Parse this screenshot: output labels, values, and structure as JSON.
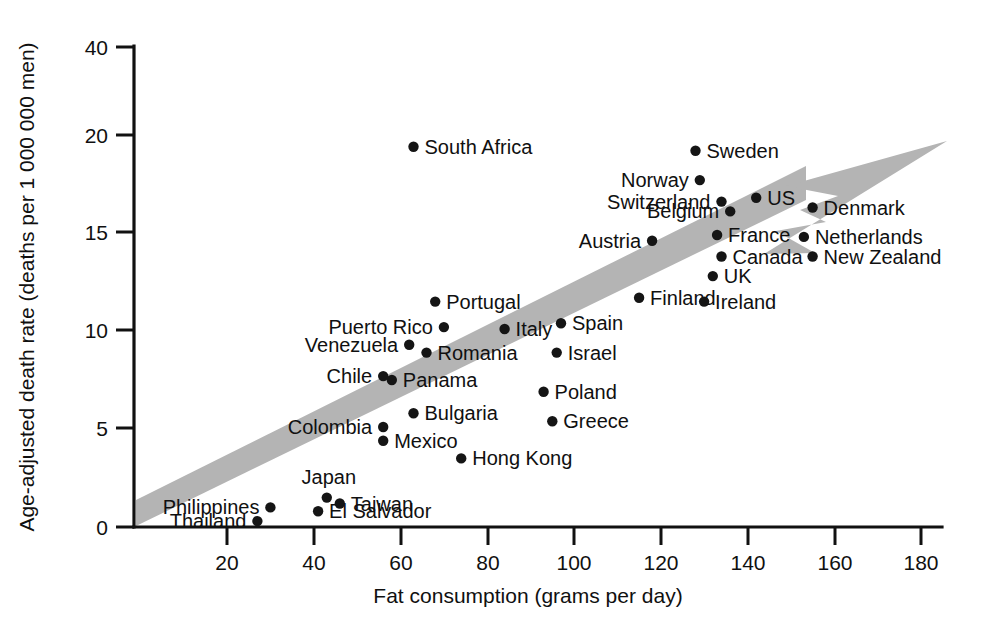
{
  "chart_data": {
    "type": "scatter",
    "title": "",
    "xlabel": "Fat consumption (grams per day)",
    "ylabel": "Age-adjusted death rate (deaths per 1 000 000 men)",
    "xlim": [
      0,
      183
    ],
    "ylim": [
      0,
      40
    ],
    "grid": false,
    "legend": null,
    "xticks": [
      20,
      40,
      60,
      80,
      100,
      120,
      140,
      160,
      180
    ],
    "yticks": [
      0,
      5,
      10,
      15,
      20,
      40
    ],
    "y_axis_note": "Axis is broken/compressed above 20; the 20-to-40 interval occupies the same space as a 5-unit interval.",
    "annotation": {
      "name": "trend-arrow",
      "description": "Thick gray band running from lower-left to upper-right ending in a swept-back arrowhead",
      "color": "#b4b4b4"
    },
    "points": [
      {
        "label": "Thailand",
        "x": 27,
        "y": 0.3,
        "label_pos": "left"
      },
      {
        "label": "Philippines",
        "x": 30,
        "y": 1.0,
        "label_pos": "left"
      },
      {
        "label": "El Salvador",
        "x": 41,
        "y": 0.8,
        "label_pos": "right"
      },
      {
        "label": "Japan",
        "x": 43,
        "y": 1.5,
        "label_pos": "above"
      },
      {
        "label": "Taiwan",
        "x": 46,
        "y": 1.2,
        "label_pos": "right"
      },
      {
        "label": "Colombia",
        "x": 56,
        "y": 5.1,
        "label_pos": "left"
      },
      {
        "label": "Mexico",
        "x": 56,
        "y": 4.4,
        "label_pos": "right"
      },
      {
        "label": "Chile",
        "x": 56,
        "y": 7.7,
        "label_pos": "left"
      },
      {
        "label": "Panama",
        "x": 58,
        "y": 7.5,
        "label_pos": "right"
      },
      {
        "label": "Venezuela",
        "x": 62,
        "y": 9.3,
        "label_pos": "left"
      },
      {
        "label": "Bulgaria",
        "x": 63,
        "y": 5.8,
        "label_pos": "right"
      },
      {
        "label": "South Africa",
        "x": 63,
        "y": 19.4,
        "label_pos": "right"
      },
      {
        "label": "Romania",
        "x": 66,
        "y": 8.9,
        "label_pos": "right"
      },
      {
        "label": "Portugal",
        "x": 68,
        "y": 11.5,
        "label_pos": "right"
      },
      {
        "label": "Puerto Rico",
        "x": 70,
        "y": 10.2,
        "label_pos": "left"
      },
      {
        "label": "Hong Kong",
        "x": 74,
        "y": 3.5,
        "label_pos": "right"
      },
      {
        "label": "Italy",
        "x": 84,
        "y": 10.1,
        "label_pos": "right"
      },
      {
        "label": "Poland",
        "x": 93,
        "y": 6.9,
        "label_pos": "right"
      },
      {
        "label": "Greece",
        "x": 95,
        "y": 5.4,
        "label_pos": "right"
      },
      {
        "label": "Israel",
        "x": 96,
        "y": 8.9,
        "label_pos": "right"
      },
      {
        "label": "Spain",
        "x": 97,
        "y": 10.4,
        "label_pos": "right"
      },
      {
        "label": "Finland",
        "x": 115,
        "y": 11.7,
        "label_pos": "right"
      },
      {
        "label": "Austria",
        "x": 118,
        "y": 14.6,
        "label_pos": "left"
      },
      {
        "label": "Ireland",
        "x": 130,
        "y": 11.5,
        "label_pos": "right"
      },
      {
        "label": "Sweden",
        "x": 128,
        "y": 19.2,
        "label_pos": "right"
      },
      {
        "label": "Norway",
        "x": 129,
        "y": 17.7,
        "label_pos": "left"
      },
      {
        "label": "UK",
        "x": 132,
        "y": 12.8,
        "label_pos": "right"
      },
      {
        "label": "Switzerland",
        "x": 134,
        "y": 16.6,
        "label_pos": "left"
      },
      {
        "label": "Canada",
        "x": 134,
        "y": 13.8,
        "label_pos": "right"
      },
      {
        "label": "Belgium",
        "x": 136,
        "y": 16.1,
        "label_pos": "left"
      },
      {
        "label": "France",
        "x": 133,
        "y": 14.9,
        "label_pos": "right"
      },
      {
        "label": "US",
        "x": 142,
        "y": 16.8,
        "label_pos": "right"
      },
      {
        "label": "Netherlands",
        "x": 153,
        "y": 14.8,
        "label_pos": "right"
      },
      {
        "label": "New Zealand",
        "x": 155,
        "y": 13.8,
        "label_pos": "right"
      },
      {
        "label": "Denmark",
        "x": 155,
        "y": 16.3,
        "label_pos": "right"
      }
    ]
  },
  "axes": {
    "x_title": "Fat consumption (grams per day)",
    "y_title": "Age-adjusted death rate (deaths per 1 000 000 men)",
    "x_tick_labels": [
      "20",
      "40",
      "60",
      "80",
      "100",
      "120",
      "140",
      "160",
      "180"
    ],
    "y_tick_labels": [
      "0",
      "5",
      "10",
      "15",
      "20",
      "40"
    ]
  }
}
